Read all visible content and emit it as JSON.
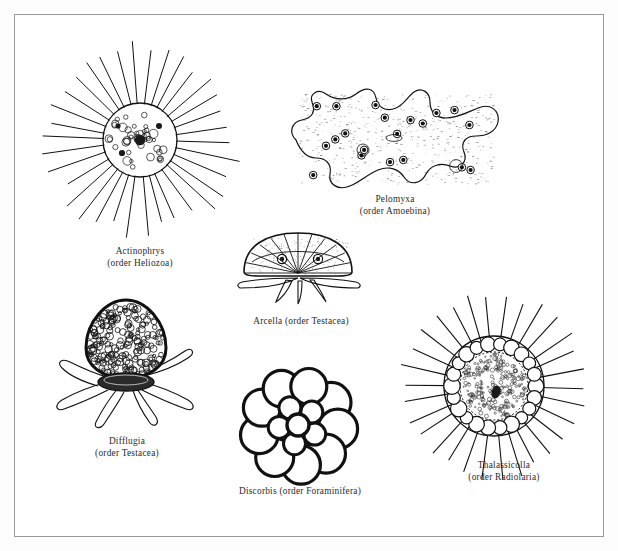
{
  "plate": {
    "title": "Protozoa plate",
    "background_color": "#ffffff",
    "border_color": "#9a9a9a",
    "ink_color": "#111111"
  },
  "figures": [
    {
      "id": "actinophrys",
      "genus": "Actinophrys",
      "order_line": "(order Heliozoa)",
      "group": "Heliozoa",
      "shape": "spherical body with radiating axopodia",
      "ray_count": 34,
      "body_radius": 37,
      "center_x": 140,
      "center_y": 140
    },
    {
      "id": "pelomyxa",
      "genus": "Pelomyxa",
      "order_line": "(order Amoebina)",
      "group": "Amoebina",
      "shape": "irregular lobed amoeba with granular cytoplasm",
      "nuclei_count": 20,
      "center_x": 395,
      "center_y": 140
    },
    {
      "id": "arcella",
      "genus": "Arcella",
      "order_line": "(order Testacea)",
      "group": "Testacea",
      "single_line_label": "Arcella (order Testacea)",
      "shape": "dome-shaped test with radial segments and pseudopodia",
      "center_x": 296,
      "center_y": 262
    },
    {
      "id": "difflugia",
      "genus": "Difflugia",
      "order_line": "(order Testacea)",
      "group": "Testacea",
      "shape": "flask-shaped sand-grain test with lobed pseudopodia",
      "center_x": 124,
      "center_y": 355
    },
    {
      "id": "discorbis",
      "genus": "Discorbis",
      "order_line": "(order Foraminifera)",
      "group": "Foraminifera",
      "single_line_label": "Discorbis (order Foraminifera)",
      "shape": "spiral multi-chambered calcareous test",
      "chamber_count": 9,
      "center_x": 298,
      "center_y": 424
    },
    {
      "id": "thalassicolla",
      "genus": "Thalassicolla",
      "order_line": "(order Radiolaria)",
      "group": "Radiolaria",
      "shape": "central capsule ringed by alveoli with radiating spines",
      "ray_count": 30,
      "alveoli_count": 22,
      "center_x": 494,
      "center_y": 385
    }
  ],
  "captions": {
    "actinophrys_l1": "Actinophrys",
    "actinophrys_l2": "(order Heliozoa)",
    "pelomyxa_l1": "Pelomyxa",
    "pelomyxa_l2": "(order Amoebina)",
    "arcella": "Arcella (order Testacea)",
    "difflugia_l1": "Difflugia",
    "difflugia_l2": "(order Testacea)",
    "discorbis": "Discorbis (order Foraminifera)",
    "thalassicolla_l1": "Thalassicolla",
    "thalassicolla_l2": "(order Radiolaria)"
  }
}
